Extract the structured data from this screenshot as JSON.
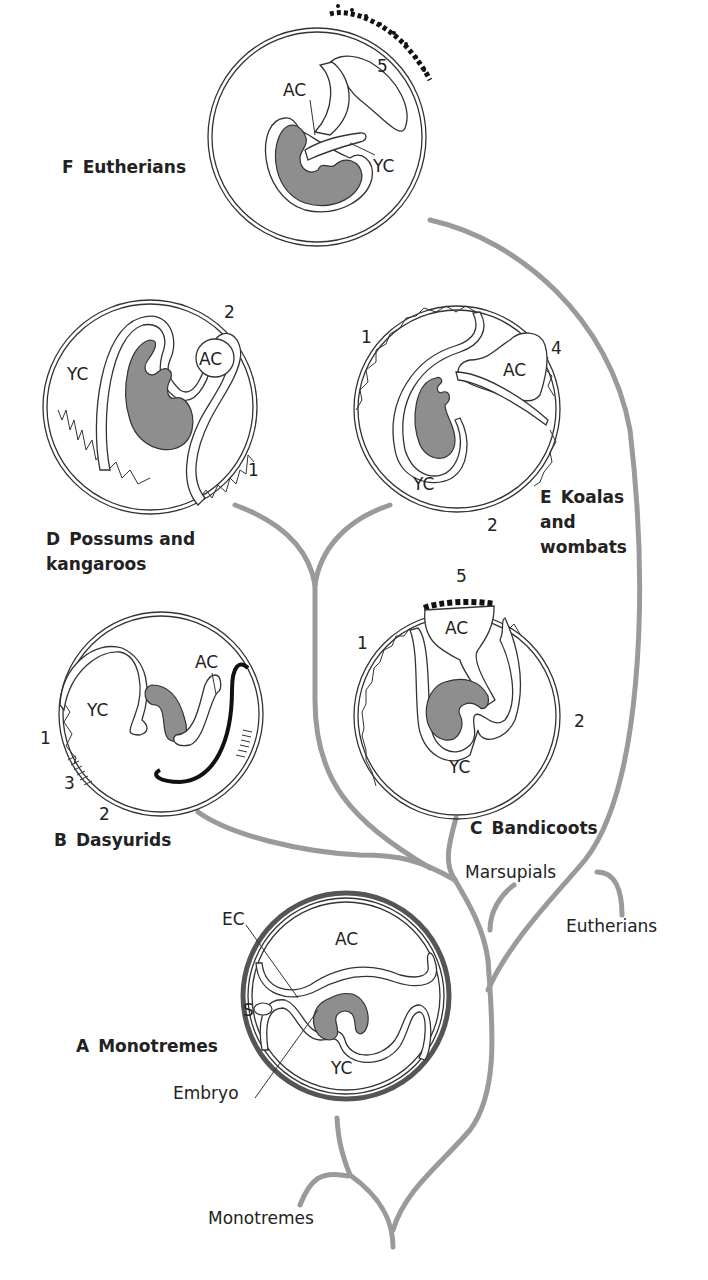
{
  "figure": {
    "panels": {
      "F": {
        "letter": "F",
        "name": "Eutherians",
        "labels": {
          "ac": "AC",
          "yc": "YC",
          "n5": "5"
        }
      },
      "D": {
        "letter": "D",
        "name_line1": "Possums and",
        "name_line2": "kangaroos",
        "labels": {
          "ac": "AC",
          "yc": "YC",
          "n1": "1",
          "n2": "2"
        }
      },
      "E": {
        "letter": "E",
        "name_line1": "Koalas",
        "name_line2": "and",
        "name_line3": "wombats",
        "labels": {
          "ac": "AC",
          "yc": "YC",
          "n1": "1",
          "n2": "2",
          "n4": "4"
        }
      },
      "B": {
        "letter": "B",
        "name": "Dasyurids",
        "labels": {
          "ac": "AC",
          "yc": "YC",
          "n1": "1",
          "n2": "2",
          "n3": "3"
        }
      },
      "C": {
        "letter": "C",
        "name": "Bandicoots",
        "labels": {
          "ac": "AC",
          "yc": "YC",
          "n1": "1",
          "n2": "2",
          "n5": "5"
        }
      },
      "A": {
        "letter": "A",
        "name": "Monotremes",
        "labels": {
          "ac": "AC",
          "yc": "YC",
          "ec": "EC",
          "s": "S",
          "embryo": "Embryo"
        }
      }
    },
    "tree": {
      "marsupials": "Marsupials",
      "eutherians": "Eutherians",
      "monotremes": "Monotremes"
    },
    "colors": {
      "branch": "#9a9a9a",
      "embryo": "#8e8e8e",
      "ink": "#222222"
    }
  }
}
